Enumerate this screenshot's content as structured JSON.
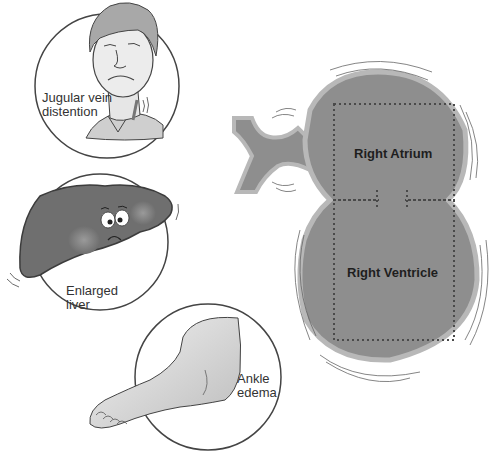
{
  "diagram": {
    "type": "medical-illustration",
    "topic": "Right-sided heart failure signs",
    "colors": {
      "background": "#ffffff",
      "heart_fill": "#8e8e8e",
      "heart_rim": "#b8b8b8",
      "outline": "#555555",
      "dotted": "#4a4a4a",
      "liver_fill": "#6f6f6f",
      "skin": "#e2e2e2",
      "text": "#333333"
    },
    "symptoms": [
      {
        "id": "jvd",
        "label": "Jugular vein\ndistention"
      },
      {
        "id": "liver",
        "label": "Enlarged\nliver"
      },
      {
        "id": "ankle",
        "label": "Ankle\nedema"
      }
    ],
    "heart": {
      "chambers": [
        {
          "id": "right-atrium",
          "label": "Right Atrium"
        },
        {
          "id": "right-ventricle",
          "label": "Right Ventricle"
        }
      ]
    }
  }
}
